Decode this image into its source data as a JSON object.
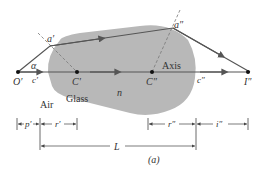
{
  "diagram": {
    "colors": {
      "glass_fill": "#b8b8b8",
      "ray": "#555555",
      "axis": "#555555",
      "dashed": "#777777",
      "text": "#333333",
      "point": "#111111"
    },
    "labels": {
      "object_point": "O′",
      "alpha": "α",
      "c_prime": "c′",
      "center_1": "C′",
      "center_2": "C″",
      "image_point": "I″",
      "c_double_prime": "c″",
      "point_a1": "a′",
      "point_a2": "a″",
      "axis": "Axis",
      "index": "n",
      "air": "Air",
      "glass": "Glass"
    },
    "dimensions": {
      "p_prime": "p′",
      "r_prime": "r′",
      "length": "L",
      "r_double_prime": "r″",
      "i_double_prime": "i″"
    },
    "caption": "(a)"
  }
}
